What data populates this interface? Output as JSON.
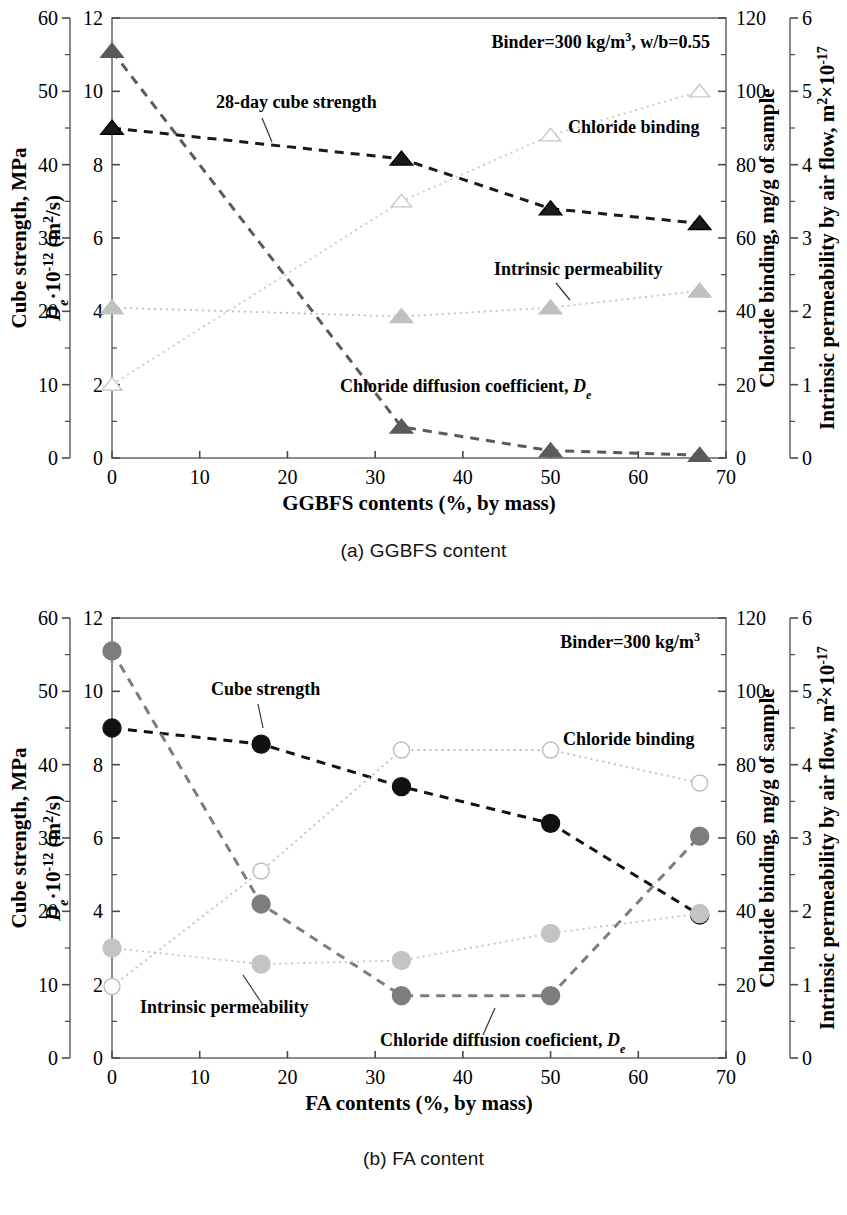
{
  "figures": [
    {
      "id": "a",
      "caption": "(a) GGBFS content",
      "annotation": "Binder=300 kg/m3, w/b=0.55",
      "annotation_html_parts": {
        "pre": "Binder=300 kg/m",
        "sup": "3",
        "post": ", w/b=0.55"
      },
      "labels": {
        "cube_strength": "28-day cube strength",
        "chloride_binding": "Chloride binding",
        "intrinsic_permeability": "Intrinsic permeability",
        "chloride_diffusion": "Chloride diffusion coefficient, D"
      },
      "axes": {
        "x_title": "GGBFS contents (%, by mass)",
        "y_left_outer_title": "Cube strength, MPa",
        "y_left_inner_title_main": "D",
        "y_left_inner_title_sub": "e",
        "y_left_inner_title_rest": "10",
        "y_left_inner_exp": "-12",
        "y_left_inner_units": "(m2/s)",
        "y_right_inner_title": "Chloride binding, mg/g of sample",
        "y_right_outer_title": "Intrinsic permeability by air flow, m2x10-17",
        "x_ticks": [
          "0",
          "10",
          "20",
          "30",
          "40",
          "50",
          "60",
          "70"
        ],
        "y_left_outer_ticks": [
          "0",
          "10",
          "20",
          "30",
          "40",
          "50",
          "60"
        ],
        "y_left_inner_ticks": [
          "0",
          "2",
          "4",
          "6",
          "8",
          "10",
          "12"
        ],
        "y_right_inner_ticks": [
          "0",
          "20",
          "40",
          "60",
          "80",
          "100",
          "120"
        ],
        "y_right_outer_ticks": [
          "0",
          "1",
          "2",
          "3",
          "4",
          "5",
          "6"
        ]
      }
    },
    {
      "id": "b",
      "caption": "(b) FA content",
      "annotation": "Binder=300 kg/m3",
      "annotation_html_parts": {
        "pre": "Binder=300 kg/m",
        "sup": "3",
        "post": ""
      },
      "labels": {
        "cube_strength": "Cube strength",
        "chloride_binding": "Chloride binding",
        "intrinsic_permeability": "Intrinsic permeability",
        "chloride_diffusion": "Chloride diffusion coeficient, D"
      },
      "axes": {
        "x_title": "FA contents (%, by mass)",
        "y_left_outer_title": "Cube strength, MPa",
        "y_left_inner_title_main": "D",
        "y_left_inner_title_sub": "e",
        "y_left_inner_title_rest": "10",
        "y_left_inner_exp": "-12",
        "y_left_inner_units": "(m2/s)",
        "y_right_inner_title": "Chloride binding, mg/g of sample",
        "y_right_outer_title": "Intrinsic permeability by air flow, m2x10-17",
        "x_ticks": [
          "0",
          "10",
          "20",
          "30",
          "40",
          "50",
          "60",
          "70"
        ],
        "y_left_outer_ticks": [
          "0",
          "10",
          "20",
          "30",
          "40",
          "50",
          "60"
        ],
        "y_left_inner_ticks": [
          "0",
          "2",
          "4",
          "6",
          "8",
          "10",
          "12"
        ],
        "y_right_inner_ticks": [
          "0",
          "20",
          "40",
          "60",
          "80",
          "100",
          "120"
        ],
        "y_right_outer_ticks": [
          "0",
          "1",
          "2",
          "3",
          "4",
          "5",
          "6"
        ]
      }
    }
  ],
  "chart_data": [
    {
      "type": "line",
      "title": "(a) GGBFS content",
      "subtitle": "Binder=300 kg/m3, w/b=0.55",
      "xlabel": "GGBFS contents (%, by mass)",
      "ylabel": "Cube strength, MPa / De 10^-12 (m2/s)",
      "xlim": [
        0,
        70
      ],
      "x": [
        0,
        33,
        50,
        67
      ],
      "grid": false,
      "legend": "inline-annotations",
      "marker": "triangle",
      "series": [
        {
          "name": "28-day cube strength",
          "axis": "left-outer",
          "unit": "MPa",
          "ylim": [
            0,
            60
          ],
          "values": [
            45,
            40.8,
            34,
            32
          ],
          "marker": "triangle-filled",
          "color": "#1a1a1a",
          "line": "dashed"
        },
        {
          "name": "Chloride diffusion coefficient, De",
          "axis": "left-inner",
          "unit": "10^-12 m2/s",
          "ylim": [
            0,
            12
          ],
          "values": [
            11.1,
            0.85,
            0.2,
            0.08
          ],
          "marker": "triangle-filled",
          "color": "#5a5a5a",
          "line": "dashed"
        },
        {
          "name": "Chloride binding",
          "axis": "right-inner",
          "unit": "mg/g of sample",
          "ylim": [
            0,
            120
          ],
          "values": [
            20,
            70,
            88,
            100
          ],
          "marker": "triangle-open",
          "color": "#c8c8c8",
          "line": "dotted"
        },
        {
          "name": "Intrinsic permeability",
          "axis": "right-outer",
          "unit": "m2 x 10^-17",
          "ylim": [
            0,
            6
          ],
          "values": [
            2.05,
            1.93,
            2.05,
            2.28
          ],
          "marker": "triangle-filled",
          "color": "#c0c0c0",
          "line": "dotted"
        }
      ]
    },
    {
      "type": "line",
      "title": "(b) FA content",
      "subtitle": "Binder=300 kg/m3",
      "xlabel": "FA contents (%, by mass)",
      "ylabel": "Cube strength, MPa / De 10^-12 (m2/s)",
      "xlim": [
        0,
        70
      ],
      "x": [
        0,
        17,
        33,
        50,
        67
      ],
      "grid": false,
      "legend": "inline-annotations",
      "marker": "circle",
      "series": [
        {
          "name": "Cube strength",
          "axis": "left-outer",
          "unit": "MPa",
          "ylim": [
            0,
            60
          ],
          "values": [
            45,
            42.8,
            37,
            32,
            19.5
          ],
          "marker": "circle-filled",
          "color": "#111111",
          "line": "dashed"
        },
        {
          "name": "Chloride diffusion coeficient, De",
          "axis": "left-inner",
          "unit": "10^-12 m2/s",
          "ylim": [
            0,
            12
          ],
          "values": [
            11.1,
            4.2,
            1.7,
            1.7,
            6.05
          ],
          "marker": "circle-filled",
          "color": "#7d7d7d",
          "line": "dashed"
        },
        {
          "name": "Chloride binding",
          "axis": "right-inner",
          "unit": "mg/g of sample",
          "ylim": [
            0,
            120
          ],
          "values": [
            19.5,
            51,
            84,
            84,
            75
          ],
          "marker": "circle-open",
          "color": "#bdbdbd",
          "line": "dotted"
        },
        {
          "name": "Intrinsic permeability",
          "axis": "right-outer",
          "unit": "m2 x 10^-17",
          "ylim": [
            0,
            6
          ],
          "values": [
            1.5,
            1.28,
            1.33,
            1.7,
            1.97
          ],
          "marker": "circle-filled",
          "color": "#c4c4c4",
          "line": "dotted"
        }
      ]
    }
  ]
}
